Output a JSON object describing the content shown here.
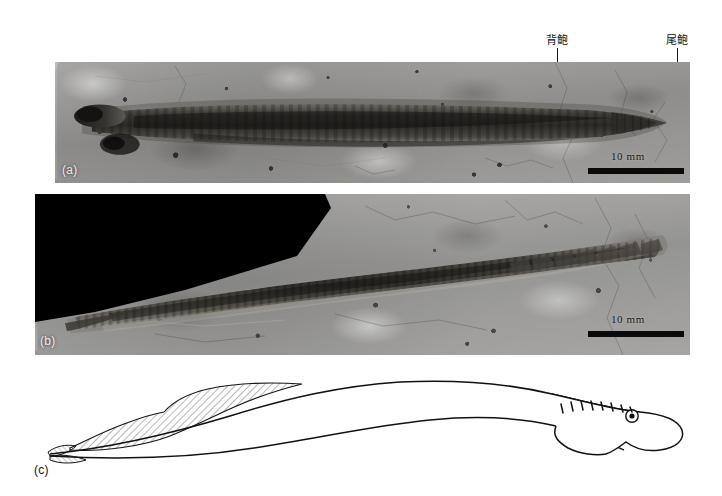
{
  "figure": {
    "caption_letters": [
      "(a)",
      "(b)",
      "(c)"
    ],
    "background_color": "#ffffff"
  },
  "annotations": [
    {
      "id": "dorsal-fin",
      "label": "背鲍",
      "meaning": "dorsal fin",
      "x": 557,
      "label_y": 38,
      "line_top": 46,
      "line_bottom": 112
    },
    {
      "id": "caudal-fin",
      "label": "尾鲍",
      "meaning": "caudal fin",
      "x": 677,
      "label_y": 38,
      "line_top": 46,
      "line_bottom": 98
    }
  ],
  "panels": [
    {
      "id": "panel-a",
      "letter": "(a)",
      "letter_x": 62,
      "letter_y": 166,
      "type": "photograph",
      "subject": "part of elongate eel-like fossil fish on rock matrix",
      "rect": {
        "x": 55,
        "y": 62,
        "w": 635,
        "h": 121
      },
      "scale_bar": {
        "label": "10 mm",
        "bar_x": 588,
        "bar_y": 170,
        "bar_w": 96,
        "text_x": 610,
        "text_y": 154
      }
    },
    {
      "id": "panel-b",
      "letter": "(b)",
      "letter_x": 40,
      "letter_y": 338,
      "type": "photograph",
      "subject": "counterpart of the same fossil specimen, oblique lighting",
      "rect": {
        "x": 35,
        "y": 194,
        "w": 655,
        "h": 161
      },
      "scale_bar": {
        "label": "10 mm",
        "bar_x": 588,
        "bar_y": 341,
        "bar_w": 96,
        "text_x": 612,
        "text_y": 325
      }
    },
    {
      "id": "panel-c",
      "letter": "(c)",
      "letter_x": 34,
      "letter_y": 470,
      "type": "line-drawing",
      "subject": "interpretive reconstruction outline of the fish with dorsal fin hatching, gill slits and eye",
      "rect": {
        "x": 55,
        "y": 372,
        "w": 635,
        "h": 100
      }
    }
  ],
  "drawing": {
    "features": [
      {
        "name": "caudal-fin-hatched",
        "description": "hatched dorsal/caudal fin region at left"
      },
      {
        "name": "body-outline",
        "description": "long sinuous dorsal and ventral body outlines"
      },
      {
        "name": "gill-slits",
        "description": "row of short oblique dashes on the head"
      },
      {
        "name": "eye",
        "description": "small circle with dark pupil near snout"
      },
      {
        "name": "head",
        "description": "rounded blunt head at right end"
      }
    ],
    "gill_slit_count": 8,
    "stroke_color": "#111111",
    "fill_color": "#ffffff"
  }
}
